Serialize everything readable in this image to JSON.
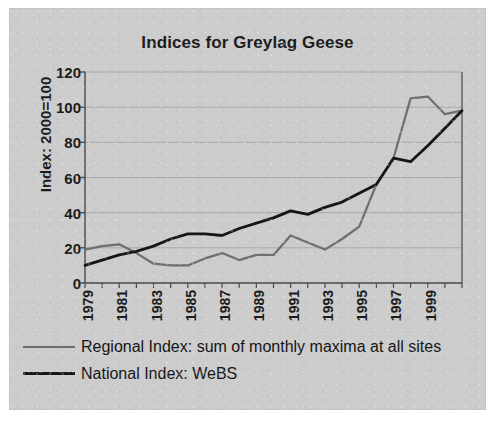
{
  "chart_data": {
    "type": "line",
    "title": "Indices for Greylag Geese",
    "xlabel": "",
    "ylabel": "Index: 2000=100",
    "ylim": [
      0,
      120
    ],
    "yticks": [
      0,
      20,
      40,
      60,
      80,
      100,
      120
    ],
    "xlim": [
      1979,
      2001
    ],
    "xticks": [
      1979,
      1981,
      1983,
      1985,
      1987,
      1989,
      1991,
      1993,
      1995,
      1997,
      1999
    ],
    "xtick_labels": [
      "1979",
      "1981",
      "1983",
      "1985",
      "1987",
      "1989",
      "1991",
      "1993",
      "1995",
      "1997",
      "1999"
    ],
    "grid": true,
    "legend_position": "below",
    "x": [
      1979,
      1980,
      1981,
      1982,
      1983,
      1984,
      1985,
      1986,
      1987,
      1988,
      1989,
      1990,
      1991,
      1992,
      1993,
      1994,
      1995,
      1996,
      1997,
      1998,
      1999,
      2000,
      2001
    ],
    "series": [
      {
        "name": "Regional Index: sum of monthly maxima at all sites",
        "color": "#6e6e6e",
        "values": [
          19,
          21,
          22,
          17,
          11,
          10,
          10,
          14,
          17,
          13,
          16,
          16,
          27,
          23,
          19,
          25,
          32,
          56,
          71,
          105,
          106,
          96,
          98
        ]
      },
      {
        "name": "National Index: WeBS",
        "color": "#161616",
        "values": [
          10,
          13,
          16,
          18,
          21,
          25,
          28,
          28,
          27,
          31,
          34,
          37,
          41,
          39,
          43,
          46,
          51,
          56,
          71,
          69,
          78,
          88,
          98
        ]
      }
    ]
  },
  "legend": [
    {
      "label": "Regional Index: sum of monthly maxima at all sites",
      "color": "#6e6e6e",
      "width": 2
    },
    {
      "label": "National Index: WeBS",
      "color": "#161616",
      "width": 3
    }
  ],
  "colors": {
    "background": "#cccccc",
    "page": "#ffffff",
    "axis": "#4a4a4a",
    "grid": "#a9a9a9",
    "text": "#1c1c1c"
  }
}
